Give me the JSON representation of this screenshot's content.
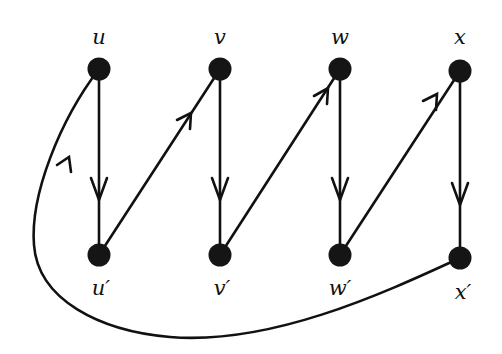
{
  "diagram": {
    "title": "",
    "type": "directed graph",
    "colors": {
      "background": "#ffffff",
      "stroke": "#111111",
      "node_fill": "#151515"
    },
    "nodes": [
      {
        "id": "u",
        "label": "u",
        "x": 99,
        "y": 69
      },
      {
        "id": "v",
        "label": "v",
        "x": 220,
        "y": 69
      },
      {
        "id": "w",
        "label": "w",
        "x": 340,
        "y": 69
      },
      {
        "id": "x",
        "label": "x",
        "x": 460,
        "y": 71
      },
      {
        "id": "u2",
        "label": "u′",
        "x": 99,
        "y": 255
      },
      {
        "id": "v2",
        "label": "v′",
        "x": 220,
        "y": 255
      },
      {
        "id": "w2",
        "label": "w′",
        "x": 340,
        "y": 255
      },
      {
        "id": "x2",
        "label": "x′",
        "x": 460,
        "y": 258
      }
    ],
    "edges": [
      {
        "from": "u",
        "to": "u2",
        "label": ""
      },
      {
        "from": "u2",
        "to": "v",
        "label": ""
      },
      {
        "from": "v",
        "to": "v2",
        "label": ""
      },
      {
        "from": "v2",
        "to": "w",
        "label": ""
      },
      {
        "from": "w",
        "to": "w2",
        "label": ""
      },
      {
        "from": "w2",
        "to": "x",
        "label": ""
      },
      {
        "from": "x",
        "to": "x2",
        "label": ""
      },
      {
        "from": "x2",
        "to": "u",
        "label": "",
        "curved": true
      }
    ]
  }
}
